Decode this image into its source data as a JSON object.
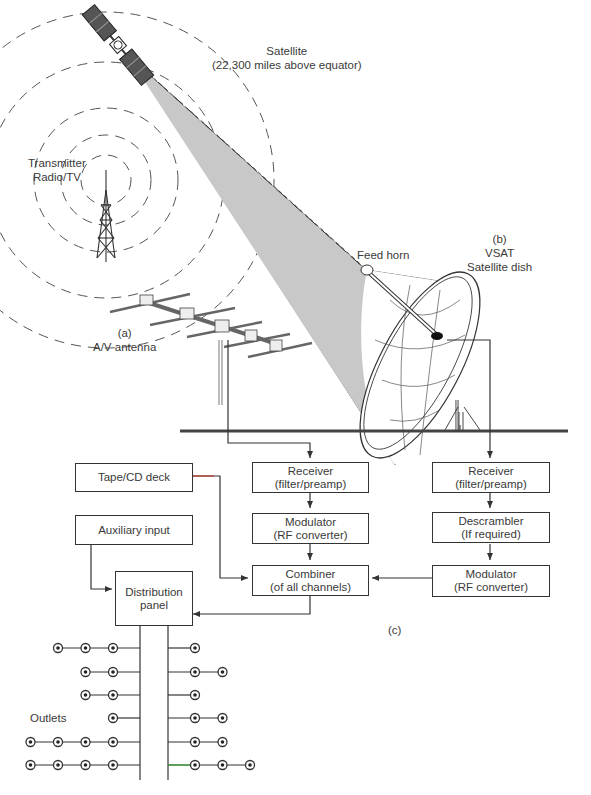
{
  "labels": {
    "satellite": {
      "line1": "Satellite",
      "line2": "(22,300 miles above equator)"
    },
    "transmitter": {
      "line1": "Transmitter",
      "line2": "Radio/TV"
    },
    "av_antenna": {
      "line1": "(a)",
      "line2": "A/V antenna"
    },
    "feed_horn": "Feed horn",
    "dish": {
      "line1": "(b)",
      "line2": "VSAT",
      "line3": "Satellite dish"
    },
    "section_c": "(c)",
    "outlets": "Outlets"
  },
  "blocks": {
    "tape_cd": {
      "line1": "Tape/CD deck"
    },
    "aux": {
      "line1": "Auxiliary input"
    },
    "distribution": {
      "line1": "Distribution",
      "line2": "panel"
    },
    "receiver_a": {
      "line1": "Receiver",
      "line2": "(filter/preamp)"
    },
    "modulator_a": {
      "line1": "Modulator",
      "line2": "(RF converter)"
    },
    "combiner": {
      "line1": "Combiner",
      "line2": "(of all channels)"
    },
    "receiver_b": {
      "line1": "Receiver",
      "line2": "(filter/preamp)"
    },
    "descrambler": {
      "line1": "Descrambler",
      "line2": "(If required)"
    },
    "modulator_b": {
      "line1": "Modulator",
      "line2": "(RF converter)"
    }
  },
  "outlets": {
    "left_rows": [
      3,
      2,
      2,
      1,
      4,
      4
    ],
    "right_rows": [
      1,
      2,
      1,
      2,
      2,
      3
    ]
  },
  "colors": {
    "line": "#333333",
    "beam": "#c8c8c8",
    "accent_red": "#c0392b",
    "accent_green": "#3aa53a"
  }
}
